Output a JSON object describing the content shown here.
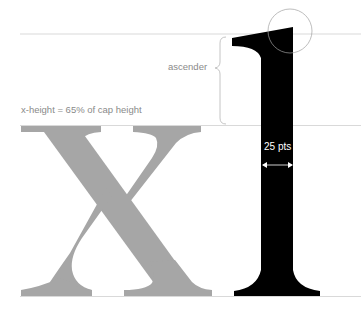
{
  "diagram": {
    "labels": {
      "ascender": "ascender",
      "x_height_note": "x-height = 65% of cap height",
      "stem_width": "25 pts"
    },
    "glyphs": [
      "x",
      "l"
    ],
    "colors": {
      "x_glyph": "#a6a6a6",
      "l_glyph": "#000000",
      "guide_lines": "#c8c8c8",
      "label_text": "#8a8a8a",
      "callout_circle": "#9a9a9a"
    }
  }
}
